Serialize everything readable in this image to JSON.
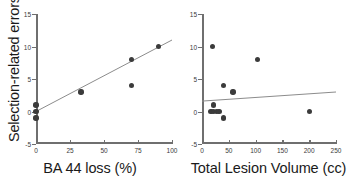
{
  "figure": {
    "background": "#ffffff",
    "point_color": "#3b3b3b",
    "axis_color": "#6f6f6f",
    "line_color": "#8c8c8c"
  },
  "chart_data": [
    {
      "type": "scatter",
      "title": "",
      "xlabel": "BA 44 loss (%)",
      "ylabel": "Selection-related errors",
      "xlim": [
        0,
        100
      ],
      "ylim": [
        -5,
        15
      ],
      "xticks": [
        0,
        25,
        50,
        75,
        100
      ],
      "xticklabels": [
        "0",
        "25",
        "50",
        "75",
        "100"
      ],
      "yticks": [
        -5,
        0,
        5,
        10,
        15
      ],
      "yticklabels": [
        "-5",
        "0",
        "5",
        "10",
        "15"
      ],
      "grid": false,
      "legend": "none",
      "points": [
        {
          "x": 0,
          "y": 1
        },
        {
          "x": 0,
          "y": 0
        },
        {
          "x": 0,
          "y": -1
        },
        {
          "x": 33,
          "y": 3
        },
        {
          "x": 70,
          "y": 8
        },
        {
          "x": 70,
          "y": 4
        },
        {
          "x": 90,
          "y": 10
        }
      ],
      "trendline": {
        "x0": 0,
        "y0": 0.0,
        "x1": 100,
        "y1": 11.0
      }
    },
    {
      "type": "scatter",
      "title": "",
      "xlabel": "Total Lesion Volume (cc)",
      "ylabel": "",
      "xlim": [
        0,
        250
      ],
      "ylim": [
        -5,
        15
      ],
      "xticks": [
        0,
        50,
        100,
        150,
        200,
        250
      ],
      "xticklabels": [
        "0",
        "50",
        "100",
        "150",
        "200",
        "250"
      ],
      "yticks": [
        -5,
        0,
        5,
        10,
        15
      ],
      "yticklabels": [
        "-5",
        "0",
        "5",
        "10",
        "15"
      ],
      "grid": false,
      "legend": "none",
      "points": [
        {
          "x": 20,
          "y": 10
        },
        {
          "x": 103,
          "y": 8
        },
        {
          "x": 40,
          "y": 4
        },
        {
          "x": 58,
          "y": 3
        },
        {
          "x": 22,
          "y": 1
        },
        {
          "x": 17,
          "y": 0
        },
        {
          "x": 22,
          "y": 0
        },
        {
          "x": 27,
          "y": 0
        },
        {
          "x": 32,
          "y": 0
        },
        {
          "x": 200,
          "y": 0
        },
        {
          "x": 40,
          "y": -1
        }
      ],
      "trendline": {
        "x0": 0,
        "y0": 1.6,
        "x1": 250,
        "y1": 3.0
      }
    }
  ]
}
